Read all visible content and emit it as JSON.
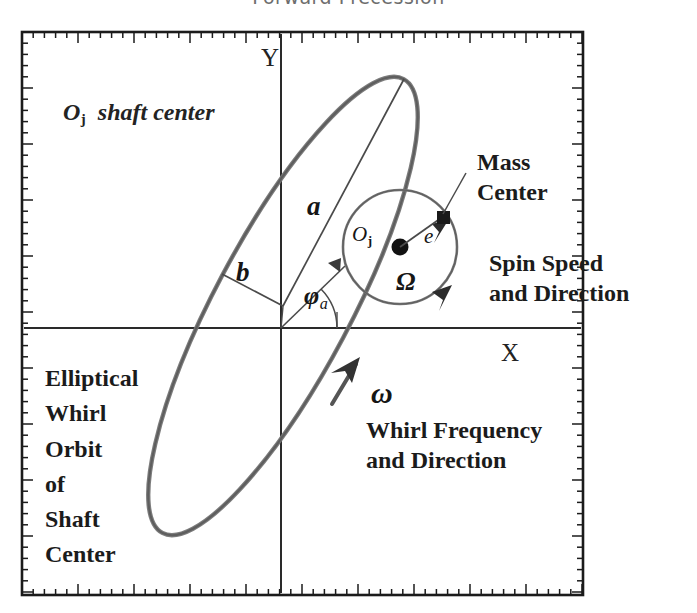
{
  "title": "Forward Precession",
  "axes": {
    "y_label": "Y",
    "x_label": "X",
    "frame": {
      "left": 22,
      "top": 32,
      "right": 583,
      "bottom": 595
    },
    "origin": {
      "x": 281,
      "y": 328
    },
    "ticks": {
      "minor_spacing_px": 11.2,
      "major_every": 5,
      "minor_len": 6,
      "major_len": 11
    }
  },
  "labels": {
    "shaft_center": {
      "symbol": "O",
      "subscript": "j",
      "text": "shaft center"
    },
    "semi_major": "a",
    "semi_minor": "b",
    "phase_angle": {
      "symbol": "φ",
      "subscript": "a"
    },
    "journal_center": {
      "symbol": "O",
      "subscript": "j"
    },
    "eccentricity": "e",
    "spin_speed_symbol": "Ω",
    "whirl_symbol": "ω",
    "mass_center": [
      "Mass",
      "Center"
    ],
    "spin_speed_direction": [
      "Spin  Speed",
      "and  Direction"
    ],
    "whirl_frequency_direction": [
      "Whirl Frequency",
      "and Direction"
    ],
    "elliptical_orbit": [
      "Elliptical",
      "Whirl",
      "Orbit",
      "of",
      "Shaft",
      "Center"
    ]
  },
  "chart_data": {
    "type": "diagram",
    "title": "Forward Precession",
    "xlabel": "X",
    "ylabel": "Y",
    "grid": false,
    "legend": "none",
    "elements": [
      {
        "name": "elliptical-whirl-orbit",
        "kind": "ellipse",
        "center_px": [
          283,
          306
        ],
        "semi_major_px": 257,
        "semi_minor_px": 68,
        "tilt_deg": -62,
        "stroke": "#6b6b6b",
        "note": "Elliptical whirl orbit of shaft center; arrowhead marks forward (counter-clockwise) whirl direction"
      },
      {
        "name": "semi-major-axis-a",
        "kind": "line",
        "from_px": [
          283,
          306
        ],
        "to_px": [
          404,
          79
        ],
        "label": "a"
      },
      {
        "name": "semi-minor-axis-b",
        "kind": "line",
        "from_px": [
          283,
          306
        ],
        "to_px": [
          222,
          274
        ],
        "label": "b"
      },
      {
        "name": "phase-angle-phi-a",
        "kind": "angle",
        "vertex_px": [
          281,
          328
        ],
        "from_deg": 0,
        "to_deg": 62,
        "label": "φa"
      },
      {
        "name": "journal-circle",
        "kind": "circle",
        "center_px": [
          400,
          247
        ],
        "radius_px": 57,
        "stroke": "#6b6b6b",
        "note": "spin orbit of mass center about journal center"
      },
      {
        "name": "journal-center-point",
        "kind": "point",
        "center_px": [
          400,
          247
        ],
        "label": "Oj",
        "fill": "#111111"
      },
      {
        "name": "eccentricity-vector-e",
        "kind": "line",
        "from_px": [
          400,
          247
        ],
        "to_px": [
          443,
          217
        ],
        "label": "e"
      },
      {
        "name": "mass-center-point",
        "kind": "point",
        "center_px": [
          443,
          217
        ],
        "label": "Mass Center",
        "fill": "#111111"
      },
      {
        "name": "spin-speed-arc-omega-cap",
        "kind": "arc",
        "center_px": [
          400,
          247
        ],
        "radius_px": 57,
        "label": "Ω",
        "note": "arrowhead on right side of circle shows spin speed and direction"
      },
      {
        "name": "whirl-arrow-omega",
        "kind": "arrowhead",
        "at_px": [
          352,
          372
        ],
        "label": "ω",
        "note": "on the elliptical orbit, pointing up-right"
      }
    ],
    "colors": {
      "frame": "#1b1b1b",
      "curve": "#6b6b6b",
      "thin_line": "#4a4a4a",
      "text": "#1b1b1b",
      "title": "#6e6e6e"
    }
  }
}
